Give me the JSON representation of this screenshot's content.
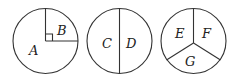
{
  "diagram": {
    "circles": [
      {
        "id": "circle-1",
        "division": "quarter sector with right angle",
        "regions": [
          {
            "label": "A",
            "fraction": "3/4"
          },
          {
            "label": "B",
            "fraction": "1/4"
          }
        ]
      },
      {
        "id": "circle-2",
        "division": "halves",
        "regions": [
          {
            "label": "C",
            "fraction": "1/2"
          },
          {
            "label": "D",
            "fraction": "1/2"
          }
        ]
      },
      {
        "id": "circle-3",
        "division": "thirds",
        "regions": [
          {
            "label": "E",
            "fraction": "1/3"
          },
          {
            "label": "F",
            "fraction": "1/3"
          },
          {
            "label": "G",
            "fraction": "1/3"
          }
        ]
      }
    ],
    "colors": {
      "stroke": "#333333",
      "background": "#ffffff"
    }
  }
}
